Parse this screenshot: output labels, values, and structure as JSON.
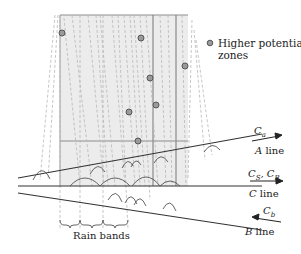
{
  "legend": {
    "marker": "circle-marker",
    "label_line1": "Higher potential",
    "label_line2": "zones"
  },
  "lines": [
    {
      "id": "A",
      "name": "A",
      "suffix": " line",
      "current": "C",
      "current_sub": "a",
      "arrow": "right"
    },
    {
      "id": "C",
      "name": "C",
      "suffix": " line",
      "current": "C",
      "current_sub": "S",
      "current2": "C",
      "current2_sub": "B",
      "arrow": "right"
    },
    {
      "id": "B",
      "name": "B",
      "suffix": " line",
      "current": "C",
      "current_sub": "b",
      "arrow": "left"
    }
  ],
  "rain_bands_label": "Rain bands",
  "colors": {
    "zone_fill": "#ececec",
    "zone_stroke": "#9a9a9a",
    "dash": "#b5b5b5",
    "line": "#333333",
    "marker_fill": "#9a9a9a",
    "marker_stroke": "#555555"
  },
  "markers": [
    {
      "x": 62,
      "y": 33
    },
    {
      "x": 141,
      "y": 38
    },
    {
      "x": 185,
      "y": 66
    },
    {
      "x": 150,
      "y": 78
    },
    {
      "x": 156,
      "y": 105
    },
    {
      "x": 129,
      "y": 112
    },
    {
      "x": 138,
      "y": 141
    }
  ]
}
